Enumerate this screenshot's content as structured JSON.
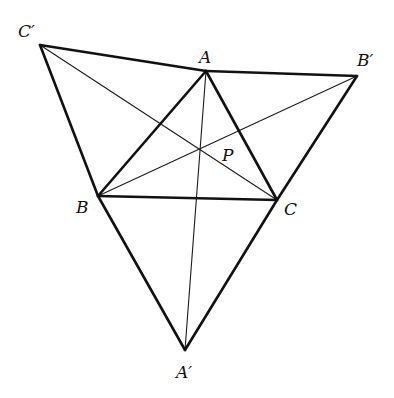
{
  "diagram": {
    "type": "geometry",
    "points": {
      "A": {
        "label": "A",
        "x": 206,
        "y": 71,
        "lx": 199,
        "ly": 63
      },
      "B": {
        "label": "B",
        "x": 98,
        "y": 196,
        "lx": 76,
        "ly": 213
      },
      "C": {
        "label": "C",
        "x": 277,
        "y": 200,
        "lx": 284,
        "ly": 215
      },
      "A'": {
        "label": "A′",
        "x": 185,
        "y": 350,
        "lx": 176,
        "ly": 378
      },
      "B'": {
        "label": "B′",
        "x": 357,
        "y": 76,
        "lx": 357,
        "ly": 66
      },
      "C'": {
        "label": "C′",
        "x": 40,
        "y": 45,
        "lx": 18,
        "ly": 37
      },
      "P": {
        "label": "P",
        "x": 200,
        "y": 148,
        "lx": 222,
        "ly": 161
      }
    },
    "thick_segments": [
      [
        "A",
        "B"
      ],
      [
        "B",
        "C"
      ],
      [
        "C",
        "A"
      ],
      [
        "C'",
        "A"
      ],
      [
        "C'",
        "B"
      ],
      [
        "A",
        "B'"
      ],
      [
        "B'",
        "C"
      ],
      [
        "B",
        "A'"
      ],
      [
        "C",
        "A'"
      ]
    ],
    "thin_segments": [
      [
        "A",
        "A'"
      ],
      [
        "B",
        "B'"
      ],
      [
        "C",
        "C'"
      ]
    ],
    "labels": {
      "A": "A",
      "B": "B",
      "C": "C",
      "A_prime": "A′",
      "B_prime": "B′",
      "C_prime": "C′",
      "P": "P"
    }
  }
}
